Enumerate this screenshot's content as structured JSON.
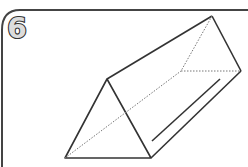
{
  "figure": {
    "number_label": "6",
    "shape": "triangular prism",
    "line_color": "#333333",
    "hidden_line_style": "dotted"
  }
}
